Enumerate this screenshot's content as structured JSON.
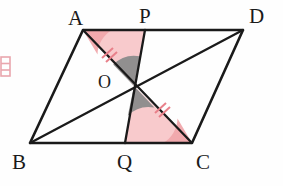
{
  "figure": {
    "canvas": {
      "width": 283,
      "height": 186,
      "background": "#fefefe"
    },
    "colors": {
      "stroke": "#1a1a1a",
      "label": "#1a1a1a",
      "pink_fill": "#f7c6c8",
      "pink_accent": "#e8808a",
      "gray_fill": "#8b8b8b",
      "margin_mark": "#e9a6ad"
    },
    "vertices": [
      {
        "name": "A",
        "label": "A",
        "x": 83,
        "y": 30,
        "label_x": 68,
        "label_y": 8
      },
      {
        "name": "P",
        "label": "P",
        "x": 145,
        "y": 30,
        "label_x": 139,
        "label_y": 6
      },
      {
        "name": "D",
        "label": "D",
        "x": 243,
        "y": 30,
        "label_x": 249,
        "label_y": 6
      },
      {
        "name": "B",
        "label": "B",
        "x": 30,
        "y": 143,
        "label_x": 12,
        "label_y": 152
      },
      {
        "name": "Q",
        "label": "Q",
        "x": 125,
        "y": 143,
        "label_x": 117,
        "label_y": 152
      },
      {
        "name": "C",
        "label": "C",
        "x": 192,
        "y": 143,
        "label_x": 196,
        "label_y": 152
      },
      {
        "name": "O",
        "label": "O",
        "x": 134,
        "y": 86,
        "label_x": 98,
        "label_y": 73
      }
    ],
    "segments": [
      {
        "name": "side-AD",
        "from": "A",
        "to": "D"
      },
      {
        "name": "side-BC",
        "from": "B",
        "to": "C"
      },
      {
        "name": "side-AB",
        "from": "A",
        "to": "B"
      },
      {
        "name": "side-DC",
        "from": "D",
        "to": "C"
      },
      {
        "name": "diagonal-AC",
        "from": "A",
        "to": "C"
      },
      {
        "name": "diagonal-BD",
        "from": "B",
        "to": "D"
      },
      {
        "name": "segment-PQ",
        "from": "P",
        "to": "Q"
      }
    ],
    "shaded_regions": [
      {
        "name": "triangle-APO",
        "points": "A,P,O",
        "fill": "pink"
      },
      {
        "name": "triangle-OQC",
        "points": "O,Q,C",
        "fill": "pink"
      },
      {
        "name": "angle-sector-AOP",
        "points": "O",
        "fill": "gray"
      },
      {
        "name": "angle-sector-QOC",
        "points": "O",
        "fill": "gray"
      }
    ],
    "angle_arcs": [
      {
        "name": "angle-at-A",
        "vertex": "A",
        "color": "pink"
      },
      {
        "name": "angle-at-C",
        "vertex": "C",
        "color": "pink"
      }
    ],
    "congruence_marks": [
      {
        "name": "tick-AO",
        "segment": "AO",
        "glyph": "//",
        "count": 2,
        "x": 107,
        "y": 53
      },
      {
        "name": "tick-OC",
        "segment": "OC",
        "glyph": "//",
        "count": 2,
        "x": 160,
        "y": 108
      }
    ],
    "margin_note": {
      "name": "margin-glyph",
      "text": "目",
      "x": -4,
      "y": 56
    }
  }
}
